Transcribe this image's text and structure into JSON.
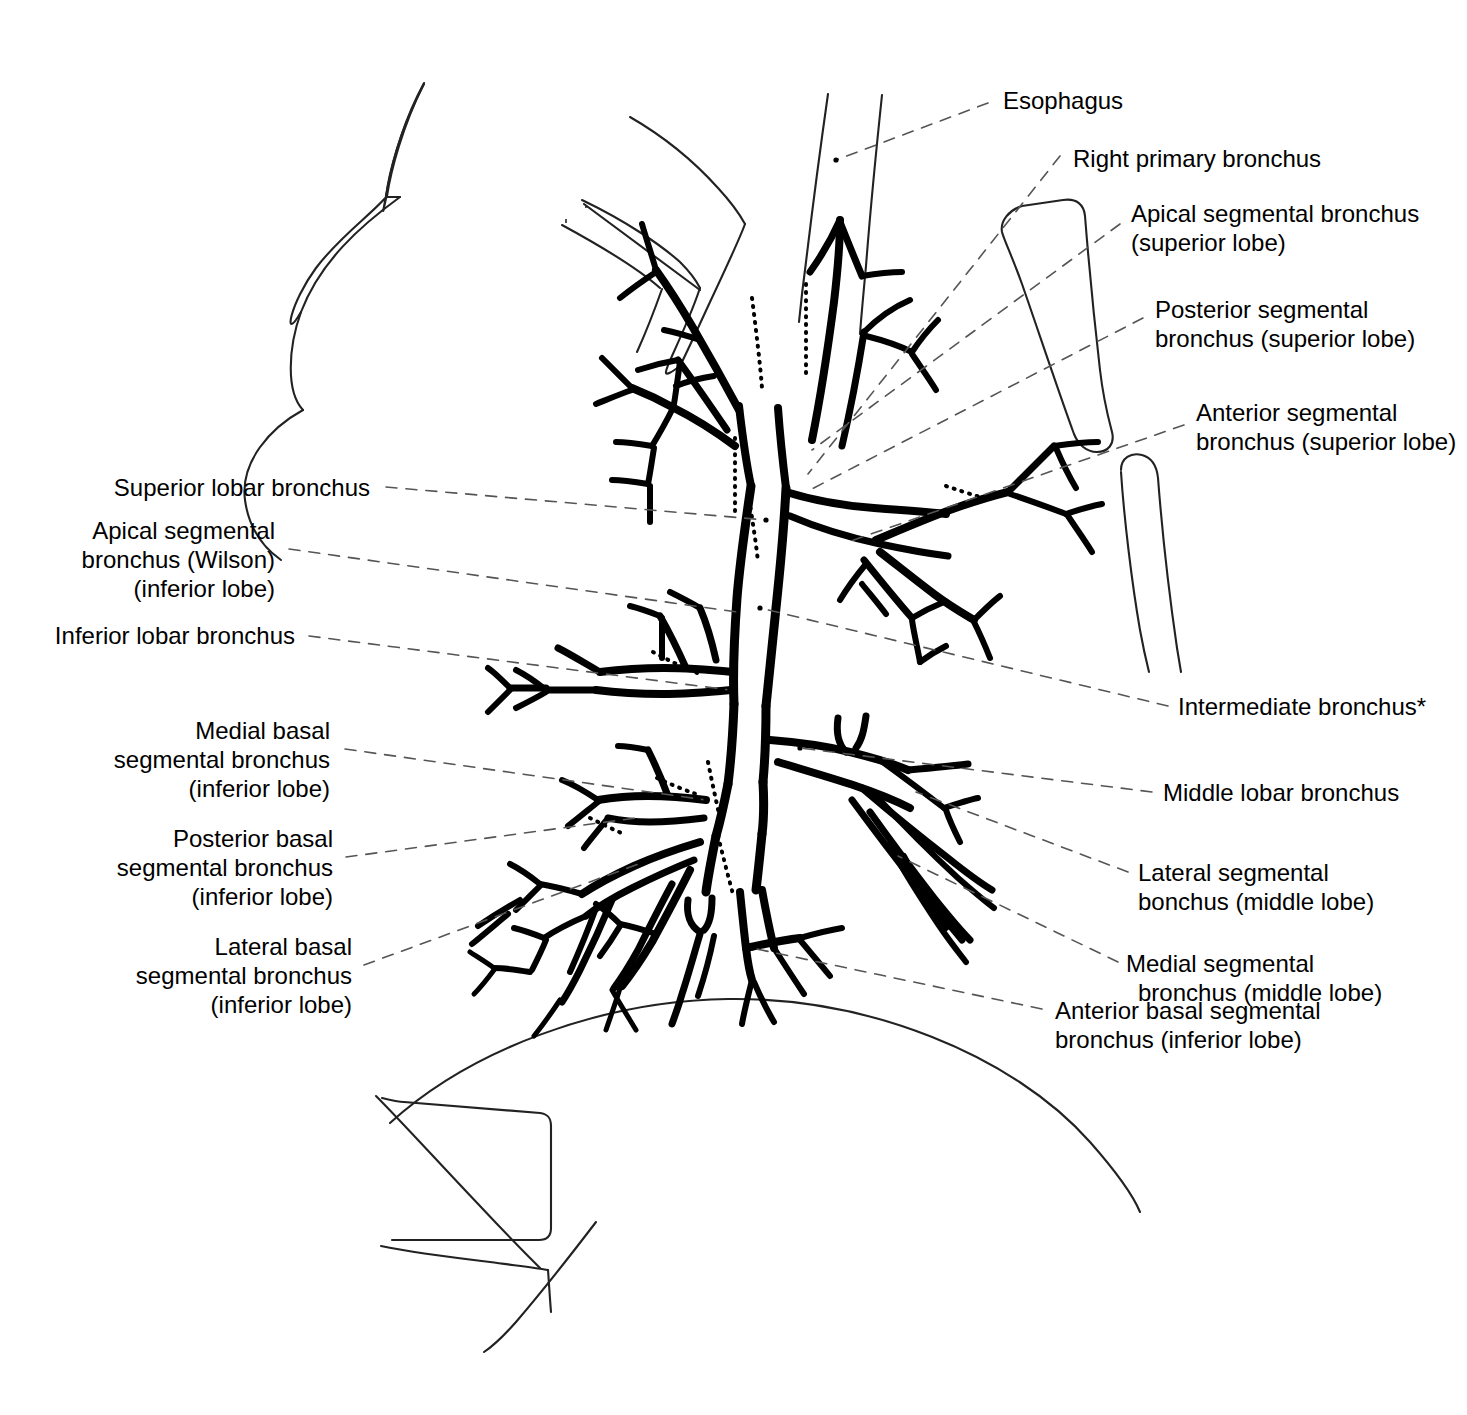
{
  "figure": {
    "background_color": "#ffffff",
    "ink_color": "#000000",
    "leader_line_color": "#555555",
    "outline_color": "#222222"
  },
  "labels": {
    "esophagus": "Esophagus",
    "right_primary_bronchus": "Right primary bronchus",
    "apical_segmental_superior_1": "Apical segmental bronchus",
    "apical_segmental_superior_2": "(superior lobe)",
    "posterior_segmental_superior_1": "Posterior segmental",
    "posterior_segmental_superior_2": "bronchus (superior lobe)",
    "anterior_segmental_superior_1": "Anterior segmental",
    "anterior_segmental_superior_2": "bronchus (superior lobe)",
    "intermediate_bronchus": "Intermediate bronchus*",
    "middle_lobar_bronchus": "Middle lobar bronchus",
    "lateral_segmental_middle_1": "Lateral segmental",
    "lateral_segmental_middle_2": "bonchus (middle lobe)",
    "medial_segmental_middle_1": "Medial segmental",
    "medial_segmental_middle_2": "bronchus (middle lobe)",
    "anterior_basal_inferior_1": "Anterior basal segmental",
    "anterior_basal_inferior_2": "bronchus (inferior lobe)",
    "superior_lobar_bronchus": "Superior lobar bronchus",
    "apical_segmental_wilson_1": "Apical segmental",
    "apical_segmental_wilson_2": "bronchus (Wilson)",
    "apical_segmental_wilson_3": "(inferior lobe)",
    "inferior_lobar_bronchus": "Inferior lobar bronchus",
    "medial_basal_inferior_1": "Medial basal",
    "medial_basal_inferior_2": "segmental bronchus",
    "medial_basal_inferior_3": "(inferior lobe)",
    "posterior_basal_inferior_1": "Posterior basal",
    "posterior_basal_inferior_2": "segmental bronchus",
    "posterior_basal_inferior_3": "(inferior lobe)",
    "lateral_basal_inferior_1": "Lateral basal",
    "lateral_basal_inferior_2": "segmental bronchus",
    "lateral_basal_inferior_3": "(inferior lobe)"
  }
}
